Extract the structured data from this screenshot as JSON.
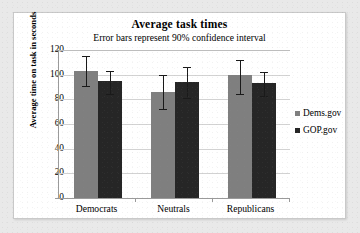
{
  "chart_data": {
    "type": "bar",
    "title": "Average task times",
    "subtitle": "Error bars represent 90% confidence interval",
    "xlabel": "",
    "ylabel": "Average time on task in seconds",
    "categories": [
      "Democrats",
      "Neutrals",
      "Republicans"
    ],
    "ylim": [
      0,
      120
    ],
    "yticks": [
      0,
      20,
      40,
      60,
      80,
      100,
      120
    ],
    "ytick_labels": [
      "0",
      "20",
      "40",
      "60",
      "80",
      "100",
      "120"
    ],
    "grid": true,
    "legend_position": "right",
    "series": [
      {
        "name": "Dems.gov",
        "color": "#7f7f7f",
        "values": [
          103,
          86,
          99.5
        ],
        "error_low": [
          12.5,
          14,
          15
        ],
        "error_high": [
          12.5,
          14,
          12.5
        ]
      },
      {
        "name": "GOP.gov",
        "color": "#262626",
        "values": [
          95,
          94,
          93
        ],
        "error_low": [
          11,
          13,
          10
        ],
        "error_high": [
          8,
          12,
          9
        ]
      }
    ]
  },
  "legend": {
    "items": [
      {
        "label": "Dems.gov",
        "color": "#7f7f7f"
      },
      {
        "label": "GOP.gov",
        "color": "#262626"
      }
    ]
  },
  "colors": {
    "series_dems": "#7f7f7f",
    "series_gop": "#262626",
    "panel_background": "#ffffff",
    "page_background": "#e9e9e9",
    "gridline": "#d2d2d2",
    "axis": "#9a9a9a"
  }
}
